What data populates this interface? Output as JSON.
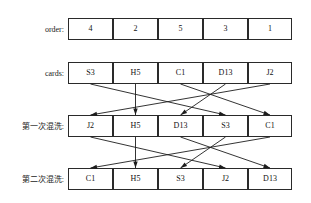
{
  "diagram": {
    "line_color": "#1d1d1a",
    "box_border_color": "#2a2a2a",
    "text_color": "#111111"
  },
  "rows": [
    {
      "id": "order",
      "label": "order:",
      "cells": [
        "4",
        "2",
        "5",
        "3",
        "1"
      ]
    },
    {
      "id": "cards",
      "label": "cards:",
      "cells": [
        "S3",
        "H5",
        "C1",
        "D13",
        "J2"
      ]
    },
    {
      "id": "shuffle1",
      "label": "第一次混洗:",
      "cells": [
        "J2",
        "H5",
        "D13",
        "S3",
        "C1"
      ]
    },
    {
      "id": "shuffle2",
      "label": "第二次混洗:",
      "cells": [
        "C1",
        "H5",
        "S3",
        "J2",
        "D13"
      ]
    }
  ],
  "mappings": [
    {
      "id": "cards-to-shuffle1",
      "from_row": "cards",
      "to_row": "shuffle1",
      "pairs": [
        {
          "from": 1,
          "to": 4
        },
        {
          "from": 2,
          "to": 2
        },
        {
          "from": 3,
          "to": 5
        },
        {
          "from": 4,
          "to": 3
        },
        {
          "from": 5,
          "to": 1
        }
      ]
    },
    {
      "id": "shuffle1-to-shuffle2",
      "from_row": "shuffle1",
      "to_row": "shuffle2",
      "pairs": [
        {
          "from": 1,
          "to": 4
        },
        {
          "from": 2,
          "to": 2
        },
        {
          "from": 3,
          "to": 5
        },
        {
          "from": 4,
          "to": 3
        },
        {
          "from": 5,
          "to": 1
        }
      ]
    }
  ]
}
